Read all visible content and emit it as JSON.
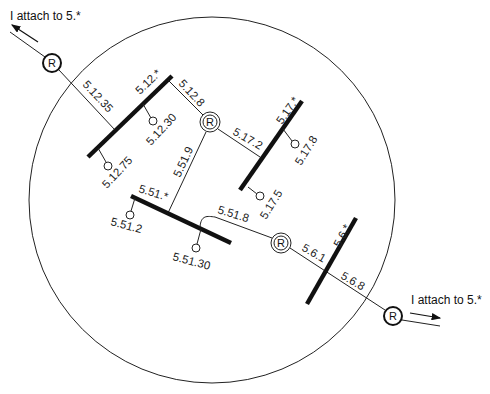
{
  "diagram": {
    "external_routers": [
      {
        "label": "R",
        "note": "I attach to 5.*"
      },
      {
        "label": "R",
        "note": "I attach to 5.*"
      }
    ],
    "internal_routers": [
      {
        "label": "R"
      },
      {
        "label": "R"
      }
    ],
    "subnets": [
      {
        "name": "5.12.*",
        "hosts": [
          "5.12.35",
          "5.12.30",
          "5.12.75",
          "5.12.8"
        ]
      },
      {
        "name": "5.17.*",
        "hosts": [
          "5.17.2",
          "5.17.8",
          "5.17.5"
        ]
      },
      {
        "name": "5.51.*",
        "hosts": [
          "5.51.9",
          "5.51.2",
          "5.51.30",
          "5.51.8"
        ]
      },
      {
        "name": "5.6.*",
        "hosts": [
          "5.6.1",
          "5.6.8"
        ]
      }
    ],
    "labels": {
      "ext_note_top": "I attach to 5.*",
      "ext_note_bottom": "I attach to 5.*",
      "r_top": "R",
      "r_bottom": "R",
      "r_inner1": "R",
      "r_inner2": "R",
      "s512": "5.12.*",
      "h5_12_35": "5.12.35",
      "h5_12_30": "5.12.30",
      "h5_12_75": "5.12.75",
      "h5_12_8": "5.12.8",
      "s517": "5.17.*",
      "h5_17_2": "5.17.2",
      "h5_17_8": "5.17.8",
      "h5_17_5": "5.17.5",
      "s551": "5.51.*",
      "h5_51_9": "5.51.9",
      "h5_51_2": "5.51.2",
      "h5_51_30": "5.51.30",
      "h5_51_8": "5.51.8",
      "s56": "5.6.*",
      "h5_6_1": "5.6.1",
      "h5_6_8": "5.6.8"
    }
  }
}
